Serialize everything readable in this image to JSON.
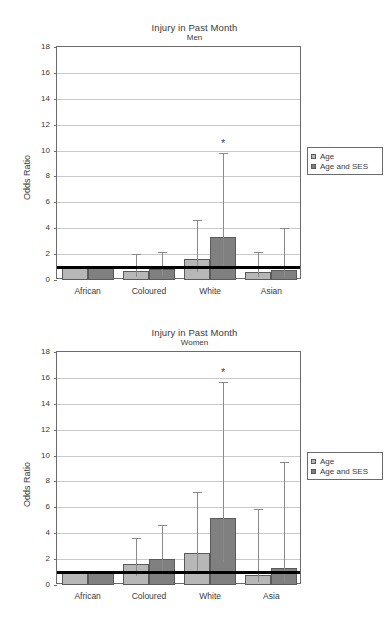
{
  "figure": {
    "panels": [
      {
        "title": "Injury in Past Month",
        "subtitle": "Men",
        "ylabel": "Odds Ratio",
        "legend": {
          "items": [
            "Age",
            "Age and SES"
          ]
        }
      },
      {
        "title": "Injury in Past Month",
        "subtitle": "Women",
        "ylabel": "Odds Ratio",
        "legend": {
          "items": [
            "Age",
            "Age and SES"
          ]
        }
      }
    ]
  },
  "colors": {
    "series_age": "#b7b7b7",
    "series_age_ses": "#808080",
    "reference_line": "#000000",
    "grid": "#c9c9c9",
    "axis": "#6b6b6b",
    "text": "#3a3a3a"
  },
  "chart_data": [
    {
      "type": "bar",
      "title": "Injury in Past Month",
      "subtitle": "Men",
      "xlabel": "",
      "ylabel": "Odds Ratio",
      "ylim": [
        0,
        18
      ],
      "yticks": [
        0,
        2,
        4,
        6,
        8,
        10,
        12,
        14,
        16,
        18
      ],
      "grid": true,
      "legend_position": "right",
      "reference_line": 1.0,
      "categories": [
        "African",
        "Coloured",
        "White",
        "Asian"
      ],
      "series": [
        {
          "name": "Age",
          "values": [
            1.0,
            0.7,
            1.6,
            0.6
          ],
          "ci_low": [
            null,
            0.25,
            0.6,
            0.2
          ],
          "ci_high": [
            null,
            2.0,
            4.6,
            2.2
          ]
        },
        {
          "name": "Age and SES",
          "values": [
            1.0,
            0.85,
            3.3,
            0.75
          ],
          "ci_low": [
            null,
            0.3,
            1.1,
            0.2
          ],
          "ci_high": [
            null,
            2.2,
            9.8,
            4.0
          ]
        }
      ],
      "annotations": [
        {
          "text": "*",
          "category": "White",
          "series": "Age and SES",
          "y": 10.5
        }
      ]
    },
    {
      "type": "bar",
      "title": "Injury in Past Month",
      "subtitle": "Women",
      "xlabel": "",
      "ylabel": "Odds Ratio",
      "ylim": [
        0,
        18
      ],
      "yticks": [
        0,
        2,
        4,
        6,
        8,
        10,
        12,
        14,
        16,
        18
      ],
      "grid": true,
      "legend_position": "right",
      "reference_line": 1.0,
      "categories": [
        "African",
        "Coloured",
        "White",
        "Asia"
      ],
      "series": [
        {
          "name": "Age",
          "values": [
            1.0,
            1.65,
            2.5,
            0.8
          ],
          "ci_low": [
            null,
            0.7,
            1.0,
            0.2
          ],
          "ci_high": [
            null,
            3.65,
            7.2,
            5.9
          ]
        },
        {
          "name": "Age and SES",
          "values": [
            1.0,
            2.0,
            5.2,
            1.3
          ],
          "ci_low": [
            null,
            0.8,
            1.8,
            0.25
          ],
          "ci_high": [
            null,
            4.6,
            15.7,
            9.5
          ]
        }
      ],
      "annotations": [
        {
          "text": "*",
          "category": "White",
          "series": "Age and SES",
          "y": 16.4
        }
      ]
    }
  ]
}
